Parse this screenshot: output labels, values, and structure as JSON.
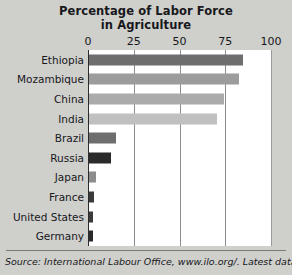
{
  "chart_data": {
    "type": "bar",
    "orientation": "horizontal",
    "title": "Percentage of Labor Force in Agriculture",
    "title_line1": "Percentage of Labor Force",
    "title_line2": "in Agriculture",
    "xlabel": "",
    "ylabel": "",
    "xlim": [
      0,
      100
    ],
    "xticks": [
      0,
      25,
      50,
      75,
      100
    ],
    "xtick_labels": [
      "0",
      "25",
      "50",
      "75",
      "100"
    ],
    "grid": true,
    "legend": false,
    "categories": [
      "Ethiopia",
      "Mozambique",
      "China",
      "India",
      "Brazil",
      "Russia",
      "Japan",
      "France",
      "United States",
      "Germany"
    ],
    "values": [
      84,
      82,
      74,
      70,
      15,
      12,
      4,
      3,
      2,
      2
    ],
    "bar_colors": [
      "#6e6e6e",
      "#9c9c9c",
      "#ababab",
      "#c0c0c0",
      "#6e6e6e",
      "#2a2a2a",
      "#8d8d8d",
      "#3a3a3a",
      "#3a3a3a",
      "#2a2a2a"
    ]
  },
  "source": {
    "text": "Source: International Labour Office, www.ilo.org/. Latest data."
  },
  "colors": {
    "background": "#cfcfcb",
    "plot_background": "#ffffff",
    "axis": "#2b2b2b",
    "gridline": "#8c8c8c",
    "text": "#17171c"
  }
}
